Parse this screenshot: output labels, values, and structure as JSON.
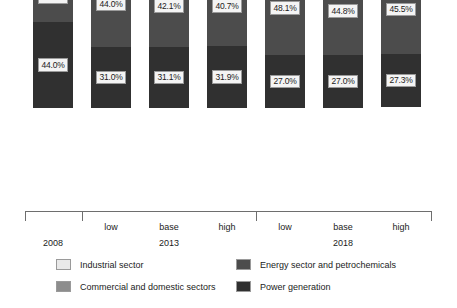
{
  "chart_data": {
    "type": "bar",
    "title": "",
    "subtitle": "",
    "xlabel": "",
    "ylabel": "",
    "ylim": [
      0,
      100
    ],
    "grid": false,
    "stacked": true,
    "stack_mode": "percent",
    "orientation": "vertical",
    "legend_position": "bottom",
    "categories": [
      "2008",
      "low",
      "base",
      "high",
      "low",
      "base",
      "high"
    ],
    "groups": [
      {
        "name": "2008",
        "members": [
          "2008"
        ]
      },
      {
        "name": "2013",
        "members": [
          "low",
          "base",
          "high"
        ]
      },
      {
        "name": "2018",
        "members": [
          "low",
          "base",
          "high"
        ]
      }
    ],
    "series": [
      {
        "name": "Industrial sector",
        "color": "#e9e9e9",
        "values": [
          11.7,
          8.8,
          10.3,
          10.8,
          8.3,
          11.4,
          11.4
        ],
        "labels": [
          "11.7%",
          "8.8%",
          "10.3%",
          "10.8%",
          "8.3%",
          "11.4%",
          "11.4%"
        ]
      },
      {
        "name": "Commercial and domestic sectors",
        "color": "#8d8d8d",
        "values": [
          19.5,
          16.2,
          16.5,
          16.7,
          16.6,
          16.8,
          15.5
        ],
        "labels": [
          "19.5%",
          "16.2%",
          "16.5%",
          "16.7%",
          "16.6%",
          "16.8%",
          "15.5%"
        ]
      },
      {
        "name": "Energy sector and petrochemicals",
        "color": "#4c4c4c",
        "values": [
          24.8,
          44.0,
          42.1,
          40.7,
          48.1,
          44.8,
          45.5
        ],
        "labels": [
          "24.8%",
          "44.0%",
          "42.1%",
          "40.7%",
          "48.1%",
          "44.8%",
          "45.5%"
        ]
      },
      {
        "name": "Power generation",
        "color": "#303030",
        "values": [
          44.0,
          31.0,
          31.1,
          31.9,
          27.0,
          27.0,
          27.3
        ],
        "labels": [
          "44.0%",
          "31.0%",
          "31.1%",
          "31.9%",
          "27.0%",
          "27.0%",
          "27.3%"
        ]
      }
    ]
  },
  "axis": {
    "group_labels": [
      "2008",
      "2013",
      "2018"
    ],
    "tick_labels": [
      "",
      "low",
      "base",
      "high",
      "low",
      "base",
      "high"
    ]
  },
  "legend": {
    "items": [
      {
        "label": "Industrial sector",
        "color": "#e9e9e9"
      },
      {
        "label": "Energy sector and petrochemicals",
        "color": "#4c4c4c"
      },
      {
        "label": "Commercial and domestic sectors",
        "color": "#8d8d8d"
      },
      {
        "label": "Power generation",
        "color": "#303030"
      }
    ]
  }
}
